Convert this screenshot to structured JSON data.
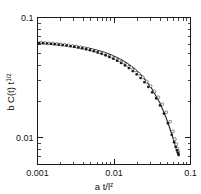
{
  "figure": {
    "background_color": "#ffffff",
    "ink_color": "#1a1a1a",
    "width": 201,
    "height": 194
  },
  "axis_titles": {
    "x_main": "a t/l",
    "x_sup": "z",
    "y_main": "b C(t) t",
    "y_sup": "1/z"
  },
  "chart_data": {
    "type": "scatter",
    "title": "",
    "subtitle": "",
    "xlabel": "a t/l^z",
    "ylabel": "b C(t) t^(1/z)",
    "xscale": "log",
    "yscale": "log",
    "xlim": [
      0.001,
      0.1
    ],
    "ylim": [
      0.006,
      0.1
    ],
    "grid": false,
    "legend": null,
    "x_tick_labels": [
      "0.001",
      "0.01",
      "0.1"
    ],
    "x_tick_values": [
      0.001,
      0.01,
      0.1
    ],
    "y_tick_labels": [
      "0.1",
      "0.01"
    ],
    "y_tick_values": [
      0.1,
      0.01
    ],
    "annotations": [],
    "series": [
      {
        "name": "collapsed data (filled markers)",
        "marker": "filled-circle",
        "color": "#1b1b1b",
        "x": [
          0.00105,
          0.00118,
          0.00133,
          0.0015,
          0.00168,
          0.0019,
          0.00213,
          0.0024,
          0.0027,
          0.00303,
          0.00341,
          0.00383,
          0.00431,
          0.00484,
          0.00545,
          0.00612,
          0.00688,
          0.00774,
          0.0087,
          0.00978,
          0.011,
          0.01237,
          0.0139,
          0.01563,
          0.01758,
          0.01976,
          0.02222,
          0.02499,
          0.0281,
          0.0316,
          0.03553,
          0.03995,
          0.04492,
          0.05051,
          0.0568,
          0.061,
          0.064,
          0.0665,
          0.0682,
          0.0693,
          0.07
        ],
        "y": [
          0.0615,
          0.0612,
          0.0608,
          0.0604,
          0.06,
          0.0595,
          0.059,
          0.0584,
          0.0577,
          0.057,
          0.0562,
          0.0554,
          0.0545,
          0.0535,
          0.0524,
          0.0512,
          0.0499,
          0.0485,
          0.047,
          0.0454,
          0.0437,
          0.0419,
          0.04,
          0.038,
          0.0359,
          0.0337,
          0.0314,
          0.029,
          0.0265,
          0.0239,
          0.0213,
          0.0186,
          0.0159,
          0.0132,
          0.0106,
          0.0092,
          0.0084,
          0.0079,
          0.00755,
          0.00735,
          0.0072
        ]
      },
      {
        "name": "collapsed data (open markers)",
        "marker": "open-circle",
        "color": "#2a2a2a",
        "x": [
          0.00112,
          0.00126,
          0.00142,
          0.0016,
          0.0018,
          0.00202,
          0.00228,
          0.00256,
          0.00288,
          0.00324,
          0.00364,
          0.0041,
          0.00461,
          0.00518,
          0.00583,
          0.00655,
          0.00737,
          0.00828,
          0.00931,
          0.01047,
          0.01177,
          0.01324,
          0.01488,
          0.01673,
          0.01881,
          0.02115,
          0.02378,
          0.02674,
          0.03007,
          0.03381,
          0.03801,
          0.04274,
          0.04806,
          0.05404,
          0.059,
          0.0625,
          0.0652,
          0.0675,
          0.069
        ],
        "y": [
          0.0618,
          0.0614,
          0.061,
          0.0606,
          0.0602,
          0.0597,
          0.0592,
          0.0586,
          0.058,
          0.0573,
          0.0565,
          0.0557,
          0.0548,
          0.0538,
          0.0527,
          0.0515,
          0.0503,
          0.0489,
          0.0474,
          0.0458,
          0.0441,
          0.0423,
          0.0404,
          0.0384,
          0.0363,
          0.0341,
          0.0318,
          0.0294,
          0.0269,
          0.0243,
          0.0217,
          0.019,
          0.0163,
          0.0136,
          0.0113,
          0.00975,
          0.00885,
          0.00815,
          0.0077
        ]
      },
      {
        "name": "master curve",
        "marker": "line",
        "color": "#222222",
        "x": [
          0.001,
          0.0013,
          0.0017,
          0.0022,
          0.0029,
          0.0038,
          0.0049,
          0.0064,
          0.0083,
          0.0108,
          0.014,
          0.0182,
          0.0236,
          0.0306,
          0.0397,
          0.047,
          0.053,
          0.058,
          0.062,
          0.065,
          0.0675,
          0.0695,
          0.0705
        ],
        "y": [
          0.0617,
          0.0609,
          0.0602,
          0.0593,
          0.0582,
          0.0568,
          0.0551,
          0.0529,
          0.0502,
          0.0468,
          0.0427,
          0.0379,
          0.0324,
          0.0262,
          0.0196,
          0.0152,
          0.0123,
          0.0103,
          0.009,
          0.0082,
          0.00765,
          0.00725,
          0.00705
        ]
      }
    ]
  }
}
